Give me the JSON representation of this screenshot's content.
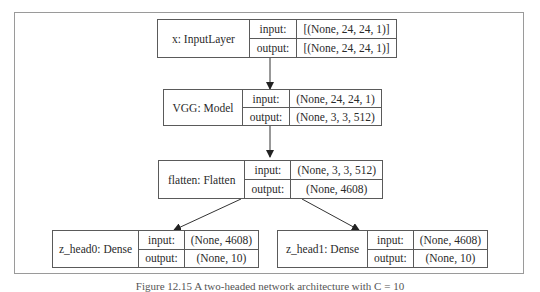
{
  "nodes": [
    {
      "id": "x",
      "name": "x: InputLayer",
      "input_label": "input:",
      "input": "[(None, 24, 24, 1)]",
      "output_label": "output:",
      "output": "[(None, 24, 24, 1)]"
    },
    {
      "id": "vgg",
      "name": "VGG: Model",
      "input_label": "input:",
      "input": "(None, 24, 24, 1)",
      "output_label": "output:",
      "output": "(None, 3, 3, 512)"
    },
    {
      "id": "flatten",
      "name": "flatten: Flatten",
      "input_label": "input:",
      "input": "(None, 3, 3, 512)",
      "output_label": "output:",
      "output": "(None, 4608)"
    },
    {
      "id": "z_head0",
      "name": "z_head0: Dense",
      "input_label": "input:",
      "input": "(None, 4608)",
      "output_label": "output:",
      "output": "(None, 10)"
    },
    {
      "id": "z_head1",
      "name": "z_head1: Dense",
      "input_label": "input:",
      "input": "(None, 4608)",
      "output_label": "output:",
      "output": "(None, 10)"
    }
  ],
  "edges": [
    {
      "from": "x",
      "to": "vgg"
    },
    {
      "from": "vgg",
      "to": "flatten"
    },
    {
      "from": "flatten",
      "to": "z_head0"
    },
    {
      "from": "flatten",
      "to": "z_head1"
    }
  ],
  "caption": "Figure 12.15 A two-headed network architecture with C = 10"
}
